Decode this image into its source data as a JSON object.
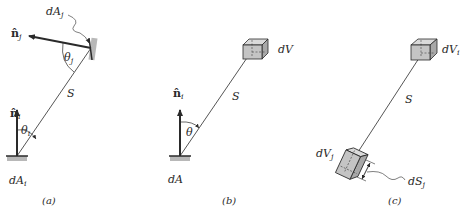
{
  "figure": {
    "panels": [
      {
        "id": "a",
        "caption": "(a)",
        "labels": {
          "dAj": "dA",
          "dAj_sub": "j",
          "nj": "n̂",
          "nj_sub": "j",
          "theta_j": "θ",
          "theta_j_sub": "j",
          "S": "S",
          "ni": "n̂",
          "ni_sub": "i",
          "theta_i": "θ",
          "theta_i_sub": "i",
          "dAi": "dA",
          "dAi_sub": "i"
        }
      },
      {
        "id": "b",
        "caption": "(b)",
        "labels": {
          "dV": "dV",
          "S": "S",
          "ni": "n̂",
          "ni_sub": "i",
          "theta": "θ",
          "dA": "dA"
        }
      },
      {
        "id": "c",
        "caption": "(c)",
        "labels": {
          "dVi": "dV",
          "dVi_sub": "i",
          "S": "S",
          "dVj": "dV",
          "dVj_sub": "j",
          "dSj": "dS",
          "dSj_sub": "j"
        }
      }
    ],
    "colors": {
      "line": "#2a2a2a",
      "surface_fill": "#b8b8b8",
      "cube_fill": "#c4c4c4",
      "cube_top": "#dadada"
    }
  }
}
